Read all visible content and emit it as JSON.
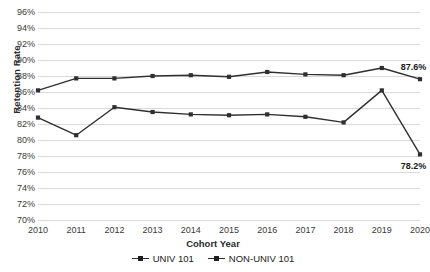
{
  "chart_data": {
    "type": "line",
    "title": "",
    "xlabel": "Cohort Year",
    "ylabel": "Retention Rate",
    "categories": [
      "2010",
      "2011",
      "2012",
      "2013",
      "2014",
      "2015",
      "2016",
      "2017",
      "2018",
      "2019",
      "2020"
    ],
    "ylim": [
      70,
      96
    ],
    "ytick_step": 2,
    "yticks": [
      "96%",
      "94%",
      "92%",
      "90%",
      "88%",
      "86%",
      "84%",
      "82%",
      "80%",
      "78%",
      "76%",
      "74%",
      "72%",
      "70%"
    ],
    "ytick_values": [
      96,
      94,
      92,
      90,
      88,
      86,
      84,
      82,
      80,
      78,
      76,
      74,
      72,
      70
    ],
    "grid": true,
    "legend_position": "bottom",
    "series": [
      {
        "name": "UNIV 101",
        "color": "#2f2f2f",
        "values": [
          86.2,
          87.7,
          87.7,
          88.0,
          88.1,
          87.9,
          88.5,
          88.2,
          88.1,
          89.0,
          87.6
        ]
      },
      {
        "name": "NON-UNIV 101",
        "color": "#2f2f2f",
        "values": [
          82.8,
          80.6,
          84.1,
          83.5,
          83.2,
          83.1,
          83.2,
          82.9,
          82.2,
          86.2,
          78.2
        ]
      }
    ],
    "annotations": [
      {
        "text": "87.6%",
        "series": "UNIV 101",
        "category": "2020",
        "value": 87.6
      },
      {
        "text": "78.2%",
        "series": "NON-UNIV 101",
        "category": "2020",
        "value": 78.2
      }
    ]
  },
  "legend": {
    "items": [
      {
        "label": "UNIV 101"
      },
      {
        "label": "NON-UNIV 101"
      }
    ]
  }
}
